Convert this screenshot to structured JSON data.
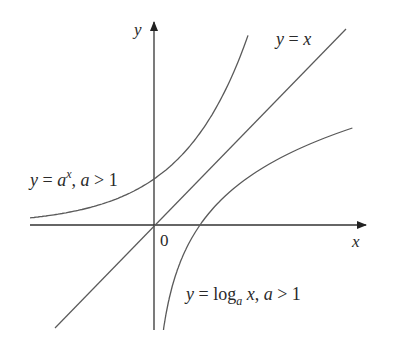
{
  "diagram": {
    "axes": {
      "x_label": "x",
      "y_label": "y",
      "origin_label": "0"
    },
    "curves": [
      {
        "id": "exponential",
        "label_parts": {
          "y": "y",
          "eq": " = ",
          "base": "a",
          "exp": "x",
          "sep": ", ",
          "a": "a",
          "cond": " > 1"
        }
      },
      {
        "id": "identity",
        "label_parts": {
          "y": "y",
          "eq": " = ",
          "x": "x"
        }
      },
      {
        "id": "logarithm",
        "label_parts": {
          "y": "y",
          "eq": " = ",
          "log": "log",
          "sub": "a",
          "x": " x",
          "sep": ", ",
          "a": "a",
          "cond": " > 1"
        }
      }
    ],
    "colors": {
      "axis": "#333333",
      "curve": "#5a5a5a",
      "text": "#2a2a2a"
    }
  }
}
